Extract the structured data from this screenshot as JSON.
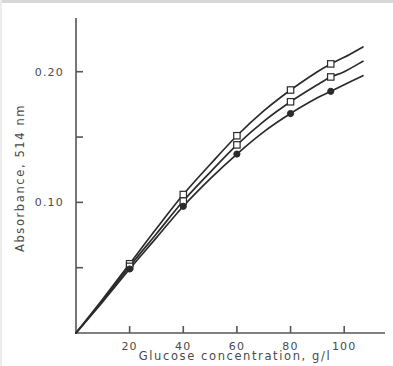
{
  "chart_data": {
    "type": "line",
    "title": "",
    "xlabel": "Glucose concentration, g/l",
    "ylabel": "Absorbance, 514 nm",
    "xlim": [
      0,
      110
    ],
    "ylim": [
      0,
      0.235
    ],
    "grid": false,
    "legend_position": "none",
    "x_ticks": [
      20,
      40,
      60,
      80,
      100
    ],
    "x_tick_labels": [
      "20",
      "40",
      "60",
      "80",
      "100"
    ],
    "y_ticks": [
      0.05,
      0.1,
      0.15,
      0.2
    ],
    "y_tick_labels": [
      "",
      "0.10",
      "",
      "0.20"
    ],
    "y_labeled_ticks": [
      {
        "value": 0.2,
        "label": "0.20"
      },
      {
        "value": 0.1,
        "label": "0.10"
      }
    ],
    "series": [
      {
        "name": "series-1-upper",
        "marker": "open-square",
        "x": [
          0,
          10,
          20,
          30,
          40,
          50,
          60,
          70,
          80,
          90,
          95,
          100,
          107
        ],
        "values": [
          0.0,
          0.026,
          0.053,
          0.08,
          0.106,
          0.129,
          0.151,
          0.17,
          0.186,
          0.2,
          0.206,
          0.211,
          0.219
        ],
        "marker_x": [
          20,
          40,
          60,
          80,
          95
        ],
        "marker_values": [
          0.053,
          0.106,
          0.151,
          0.186,
          0.206
        ]
      },
      {
        "name": "series-2-middle",
        "marker": "open-square",
        "x": [
          0,
          10,
          20,
          30,
          40,
          50,
          60,
          70,
          80,
          90,
          95,
          100,
          107
        ],
        "values": [
          0.0,
          0.025,
          0.051,
          0.076,
          0.101,
          0.123,
          0.144,
          0.162,
          0.177,
          0.19,
          0.196,
          0.2,
          0.208
        ],
        "marker_x": [
          20,
          40,
          60,
          80,
          95
        ],
        "marker_values": [
          0.051,
          0.101,
          0.144,
          0.177,
          0.196
        ]
      },
      {
        "name": "series-3-lower",
        "marker": "filled-circle",
        "x": [
          0,
          10,
          20,
          30,
          40,
          50,
          60,
          70,
          80,
          90,
          95,
          100,
          107
        ],
        "values": [
          0.0,
          0.024,
          0.049,
          0.073,
          0.097,
          0.118,
          0.137,
          0.154,
          0.168,
          0.18,
          0.185,
          0.19,
          0.197
        ],
        "marker_x": [
          20,
          40,
          60,
          80,
          95
        ],
        "marker_values": [
          0.049,
          0.097,
          0.137,
          0.168,
          0.185
        ]
      }
    ],
    "colors": {
      "line": "#2b2b2b",
      "axis": "#555555",
      "text": "#4a4a4a",
      "marker_fill": "#ffffff",
      "background": "#ffffff"
    }
  }
}
